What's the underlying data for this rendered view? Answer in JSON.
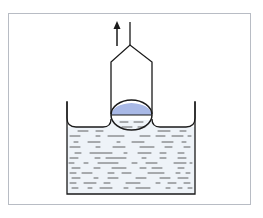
{
  "diagram": {
    "type": "physics-illustration",
    "colors": {
      "background": "#ffffff",
      "frame": "#b8bcc4",
      "line": "#1a1a1a",
      "liquid": "#eef3f8",
      "drop_fill": "#a9b9e6",
      "dash": "#3a3a3a"
    },
    "elements": {
      "arrow": {
        "direction": "up",
        "meaning": "pull direction"
      },
      "rod": {
        "label": ""
      },
      "tube": {
        "label": ""
      },
      "drop": {
        "label": ""
      },
      "beaker": {
        "label": ""
      },
      "liquid": {
        "label": ""
      }
    }
  }
}
